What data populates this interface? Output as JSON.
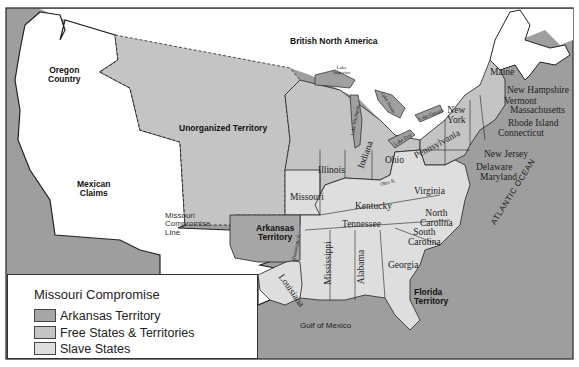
{
  "map": {
    "title": "Missouri Compromise",
    "colors": {
      "ocean": "#9e9e9e",
      "free": "#c4c4c4",
      "slave": "#dedede",
      "arkansas": "#a6a6a6",
      "unclaimed_white": "#ffffff",
      "lakes": "#a0a0a0",
      "border": "#222222"
    },
    "region_labels": {
      "british_north_america": "British North America",
      "oregon_country": "Oregon\nCountry",
      "unorganized_territory": "Unorganized Territory",
      "mexican_claims": "Mexican\nClaims",
      "missouri_compromise_line": "Missouri\nCompromise\nLine",
      "arkansas_territory": "Arkansas\nTerritory",
      "florida_territory": "Florida\nTerritory",
      "gulf_of_mexico": "Gulf of Mexico",
      "atlantic_ocean": "ATLANTIC OCEAN"
    },
    "states": {
      "maine": "Maine",
      "new_hampshire": "New Hampshire",
      "vermont": "Vermont",
      "massachusetts": "Massachusetts",
      "rhode_island": "Rhode Island",
      "connecticut": "Connecticut",
      "new_york": "New\nYork",
      "new_jersey": "New Jersey",
      "pennsylvania": "Pennsylvania",
      "delaware": "Delaware",
      "maryland": "Maryland",
      "ohio": "Ohio",
      "indiana": "Indiana",
      "illinois": "Illinois",
      "missouri": "Missouri",
      "kentucky": "Kentucky",
      "virginia": "Virginia",
      "tennessee": "Tennessee",
      "north_carolina": "North\nCarolina",
      "south_carolina": "South\nCarolina",
      "georgia": "Georgia",
      "alabama": "Alabama",
      "mississippi": "Mississippi",
      "louisiana": "Louisiana"
    },
    "water_labels": {
      "lake_superior": "Lake\nSuperior",
      "lake_michigan": "Lake Michigan",
      "lake_huron": "Lake Huron",
      "lake_erie": "Lake Erie",
      "lake_ontario": "Lake Ontario",
      "ohio_river": "Ohio R.",
      "mississippi_river": "Mississippi R."
    }
  },
  "legend": {
    "title": "Missouri Compromise",
    "items": [
      {
        "label": "Arkansas Territory",
        "color": "#a6a6a6"
      },
      {
        "label": "Free States & Territories",
        "color": "#c4c4c4"
      },
      {
        "label": "Slave States",
        "color": "#dedede"
      }
    ]
  }
}
